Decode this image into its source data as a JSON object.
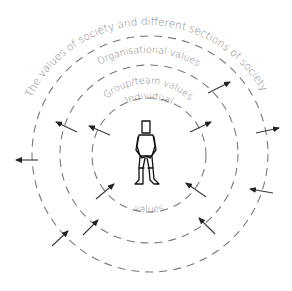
{
  "diagram": {
    "type": "concentric-values-diagram",
    "rings": [
      {
        "label": "Individual",
        "bottom_label": "values",
        "cx": 149,
        "cy": 155,
        "r": 57
      },
      {
        "label": "Group/team values",
        "cx": 149,
        "cy": 154,
        "r": 89
      },
      {
        "label": "Organisational values",
        "cx": 150,
        "cy": 154,
        "r": 118
      },
      {
        "label": "The values of society and different sections of society",
        "cx": 150,
        "cy": 155,
        "r": 147
      }
    ],
    "center_figure": "standing-person",
    "arrows": [
      {
        "x1": 38,
        "y1": 160,
        "x2": 16,
        "y2": 160
      },
      {
        "x1": 77,
        "y1": 132,
        "x2": 56,
        "y2": 122
      },
      {
        "x1": 110,
        "y1": 135,
        "x2": 89,
        "y2": 126
      },
      {
        "x1": 96,
        "y1": 199,
        "x2": 114,
        "y2": 184
      },
      {
        "x1": 83,
        "y1": 235,
        "x2": 98,
        "y2": 220
      },
      {
        "x1": 52,
        "y1": 246,
        "x2": 68,
        "y2": 231
      },
      {
        "x1": 190,
        "y1": 132,
        "x2": 211,
        "y2": 122
      },
      {
        "x1": 256,
        "y1": 133,
        "x2": 279,
        "y2": 128
      },
      {
        "x1": 206,
        "y1": 197,
        "x2": 186,
        "y2": 183
      },
      {
        "x1": 215,
        "y1": 234,
        "x2": 199,
        "y2": 218
      },
      {
        "x1": 273,
        "y1": 193,
        "x2": 250,
        "y2": 189
      },
      {
        "x1": 208,
        "y1": 93,
        "x2": 230,
        "y2": 82
      }
    ],
    "colors": {
      "ring": "#7a7a7a",
      "arrow": "#3a3a3a",
      "text": "#7e7e7e",
      "figure": "#111111"
    }
  }
}
